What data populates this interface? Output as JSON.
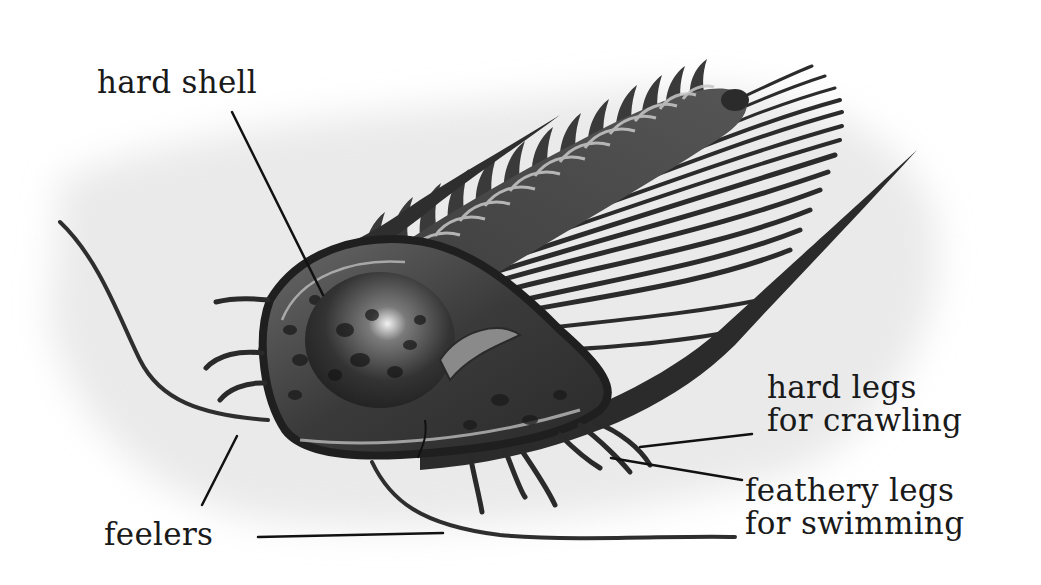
{
  "diagram": {
    "colors": {
      "background": "#ffffff",
      "wash": "#e6e6e6",
      "ink": "#1a1a1a",
      "body_dark": "#2b2b2b",
      "body_mid": "#5a5a5a",
      "body_light": "#9a9a9a",
      "highlight": "#d8d8d8"
    },
    "labels": [
      {
        "id": "hard-shell",
        "lines": [
          "hard shell"
        ],
        "x": 97,
        "y": 66,
        "leaders": [
          {
            "x1": 232,
            "y1": 112,
            "x2": 323,
            "y2": 295
          }
        ]
      },
      {
        "id": "hard-legs",
        "lines": [
          "hard legs",
          "for crawling"
        ],
        "x": 767,
        "y": 371,
        "leaders": [
          {
            "x1": 752,
            "y1": 434,
            "x2": 640,
            "y2": 447
          }
        ]
      },
      {
        "id": "feathery-legs",
        "lines": [
          "feathery legs",
          "for swimming"
        ],
        "x": 745,
        "y": 474,
        "leaders": [
          {
            "x1": 742,
            "y1": 480,
            "x2": 611,
            "y2": 458
          }
        ]
      },
      {
        "id": "feelers",
        "lines": [
          "feelers"
        ],
        "x": 104,
        "y": 518,
        "leaders": [
          {
            "x1": 202,
            "y1": 505,
            "x2": 237,
            "y2": 436
          },
          {
            "x1": 258,
            "y1": 537,
            "x2": 443,
            "y2": 533
          }
        ]
      }
    ]
  }
}
